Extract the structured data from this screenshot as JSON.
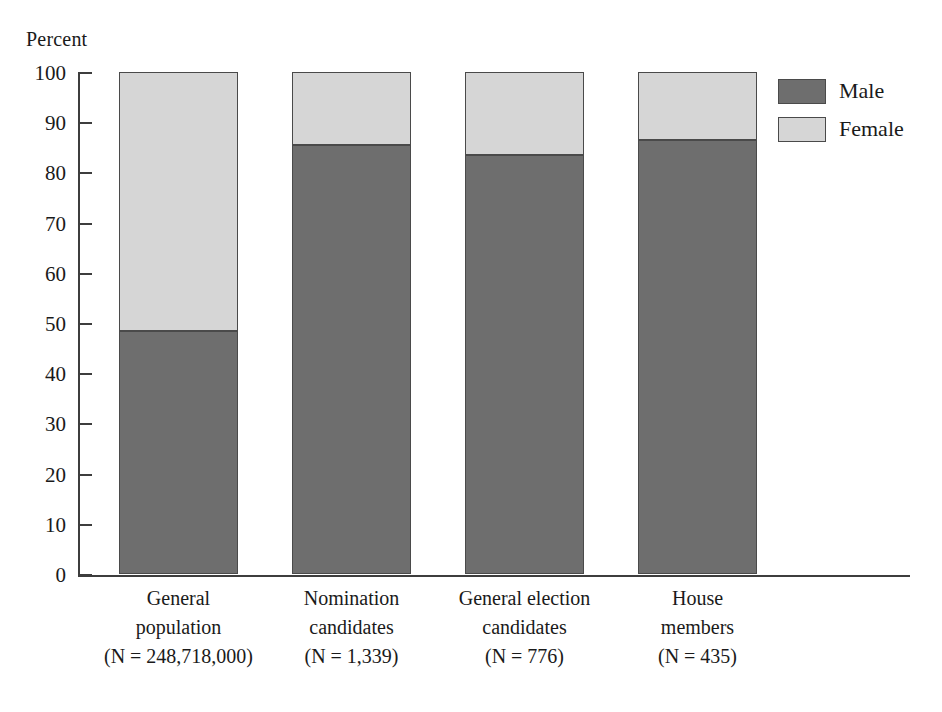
{
  "chart_data": {
    "type": "bar",
    "subtype": "stacked-100-percent",
    "title": "",
    "xlabel": "",
    "ylabel": "Percent",
    "ylim": [
      0,
      100
    ],
    "y_ticks": [
      0,
      10,
      20,
      30,
      40,
      50,
      60,
      70,
      80,
      90,
      100
    ],
    "y_tick_labels": [
      "0",
      "10",
      "20",
      "30",
      "40",
      "50",
      "60",
      "70",
      "80",
      "90",
      "100"
    ],
    "grid": false,
    "legend_position": "right-top",
    "categories": [
      "General population (N = 248,718,000)",
      "Nomination candidates (N = 1,339)",
      "General election candidates (N = 776)",
      "House members (N = 435)"
    ],
    "category_lines": [
      [
        "General",
        "population",
        "(N = 248,718,000)"
      ],
      [
        "Nomination",
        "candidates",
        "(N = 1,339)"
      ],
      [
        "General election",
        "candidates",
        "(N = 776)"
      ],
      [
        "House",
        "members",
        "(N = 435)"
      ]
    ],
    "series": [
      {
        "name": "Male",
        "color": "#6e6e6e",
        "values": [
          48.4,
          85.5,
          83.5,
          86.5
        ]
      },
      {
        "name": "Female",
        "color": "#d6d6d6",
        "values": [
          51.6,
          14.5,
          16.5,
          13.5
        ]
      }
    ]
  },
  "axis": {
    "y_title": "Percent"
  },
  "legend": {
    "items": [
      {
        "label": "Male",
        "color": "#6e6e6e"
      },
      {
        "label": "Female",
        "color": "#d6d6d6"
      }
    ]
  },
  "colors": {
    "male": "#6e6e6e",
    "female": "#d6d6d6",
    "axis": "#3d3d3d",
    "outline": "#4a4a4a",
    "background": "#ffffff",
    "text": "#1a1a1a"
  }
}
